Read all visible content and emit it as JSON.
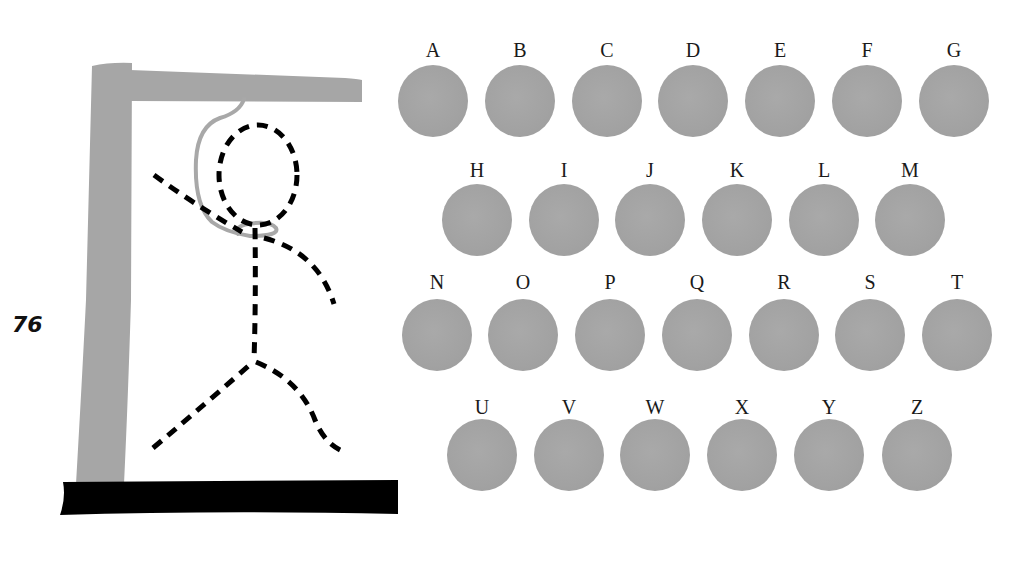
{
  "page": {
    "number": "76"
  },
  "gallows": {
    "post_color": "#a6a6a6",
    "base_color": "#000000",
    "rope_color": "#a8a8a8",
    "figure_color": "#000000",
    "figure_parts": [
      "head",
      "body",
      "left-arm",
      "right-arm",
      "left-leg",
      "right-leg"
    ]
  },
  "letters": {
    "disc_color": "#a3a3a3",
    "rows": [
      [
        "A",
        "B",
        "C",
        "D",
        "E",
        "F",
        "G"
      ],
      [
        "H",
        "I",
        "J",
        "K",
        "L",
        "M"
      ],
      [
        "N",
        "O",
        "P",
        "Q",
        "R",
        "S",
        "T"
      ],
      [
        "U",
        "V",
        "W",
        "X",
        "Y",
        "Z"
      ]
    ]
  }
}
